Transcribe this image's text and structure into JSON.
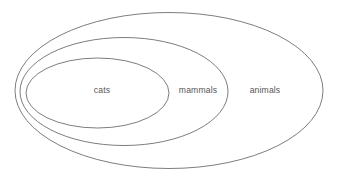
{
  "diagram": {
    "type": "euler-nested-sets",
    "background_color": "#ffffff",
    "stroke_color": "#6e6e6e",
    "label_color": "#555555",
    "canvas": {
      "width": 338,
      "height": 182
    },
    "sets": [
      {
        "name": "animals",
        "label": "animals",
        "level": 0,
        "ellipse": {
          "cx": 169,
          "cy": 90.5,
          "rx": 154,
          "ry": 78
        },
        "label_position": {
          "x": 265,
          "y": 91
        }
      },
      {
        "name": "mammals",
        "label": "mammals",
        "level": 1,
        "ellipse": {
          "cx": 124,
          "cy": 91.5,
          "rx": 104,
          "ry": 54
        },
        "label_position": {
          "x": 198,
          "y": 91
        }
      },
      {
        "name": "cats",
        "label": "cats",
        "level": 2,
        "ellipse": {
          "cx": 97.5,
          "cy": 93,
          "rx": 71.5,
          "ry": 35
        },
        "label_position": {
          "x": 102,
          "y": 91
        }
      }
    ]
  },
  "chart_data": {
    "type": "diagram",
    "subtype": "euler-diagram",
    "title": "",
    "relation": "subset",
    "categories": [
      "cats",
      "mammals",
      "animals"
    ],
    "containment": [
      {
        "child": "cats",
        "parent": "mammals"
      },
      {
        "child": "mammals",
        "parent": "animals"
      }
    ],
    "annotations": [
      "cats",
      "mammals",
      "animals"
    ],
    "legend": null,
    "grid": false
  }
}
